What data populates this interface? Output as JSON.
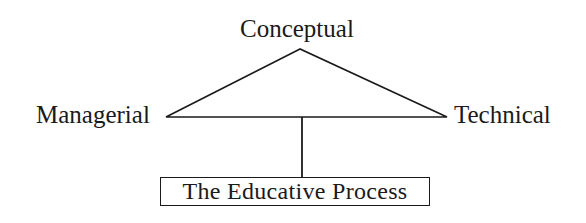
{
  "diagram": {
    "nodes": {
      "top": "Conceptual",
      "left": "Managerial",
      "right": "Technical",
      "bottom": "The Educative Process"
    },
    "edges": [
      {
        "from": "Conceptual",
        "to": "Managerial"
      },
      {
        "from": "Conceptual",
        "to": "Technical"
      },
      {
        "from": "Managerial",
        "to": "Technical"
      },
      {
        "from": "triangle-base-midpoint",
        "to": "The Educative Process"
      }
    ],
    "colors": {
      "line": "#1a1a1a",
      "background": "#ffffff"
    }
  }
}
